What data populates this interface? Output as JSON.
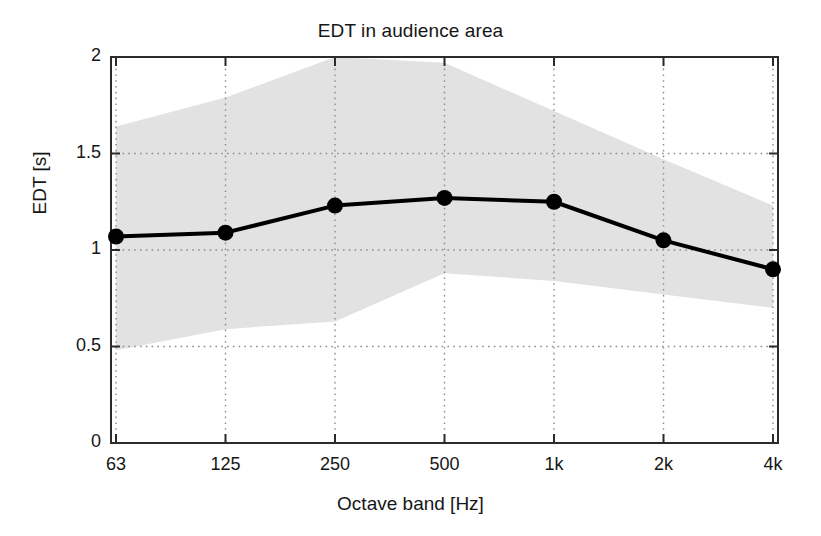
{
  "chart_data": {
    "type": "line",
    "title": "EDT in audience area",
    "xlabel": "Octave band [Hz]",
    "ylabel": "EDT [s]",
    "categories": [
      "63",
      "125",
      "250",
      "500",
      "1k",
      "2k",
      "4k"
    ],
    "xtick_labels": [
      "63",
      "125",
      "250",
      "500",
      "1k",
      "2k",
      "4k"
    ],
    "ytick_labels": [
      "0",
      "0.5",
      "1",
      "1.5",
      "2"
    ],
    "ytick_values": [
      0,
      0.5,
      1,
      1.5,
      2
    ],
    "ylim": [
      0,
      2
    ],
    "grid": "dotted-both-axes",
    "legend": "none",
    "series": [
      {
        "name": "EDT mean",
        "style": "line-with-filled-circle-markers",
        "color": "#000000",
        "values": [
          1.07,
          1.09,
          1.23,
          1.27,
          1.25,
          1.05,
          0.9
        ]
      },
      {
        "name": "EDT range upper bound",
        "style": "shaded-band-upper",
        "color": "#e0e0e0",
        "values": [
          1.64,
          1.79,
          2.0,
          1.97,
          1.72,
          1.47,
          1.23
        ]
      },
      {
        "name": "EDT range lower bound",
        "style": "shaded-band-lower",
        "color": "#e0e0e0",
        "values": [
          0.48,
          0.59,
          0.63,
          0.88,
          0.84,
          0.77,
          0.7
        ]
      }
    ],
    "band_label": "range (shaded)",
    "band_color": "#e2e2e2"
  }
}
